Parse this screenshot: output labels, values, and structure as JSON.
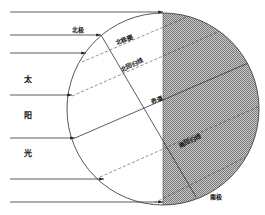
{
  "diagram": {
    "title": "",
    "sunlight_label_chars": [
      "太",
      "阳",
      "光"
    ],
    "labels": {
      "north_pole": "北极",
      "arctic_circle": "北极圈",
      "tropic_of_cancer": "北回归线",
      "equator": "赤道",
      "tropic_of_capricorn": "南回归线",
      "south_pole": "南极"
    },
    "colors": {
      "line": "#333333",
      "night_shade": "#a8a8a8",
      "background": "#ffffff"
    }
  }
}
